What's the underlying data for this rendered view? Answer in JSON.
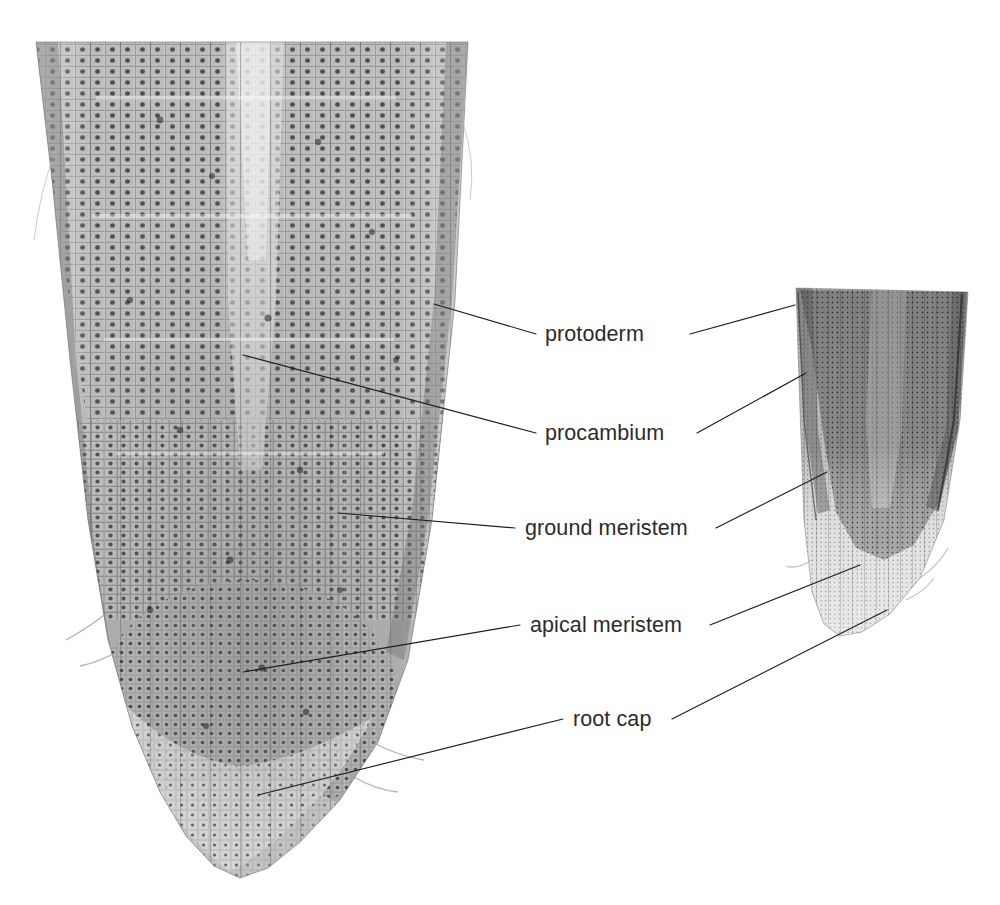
{
  "figure": {
    "kind": "micrograph-figure",
    "background_color": "#ffffff",
    "label_color": "#2b2b2b",
    "leader_line_color": "#1d1d1d",
    "specimens": [
      {
        "name": "large-root-tip-micrograph",
        "position": "left",
        "magnification_note": "high magnification",
        "description": "longitudinal section of root apex showing files of cells, dark nuclei, rounded apex",
        "tone_range": [
          "#ffffff",
          "#4a4a4a"
        ]
      },
      {
        "name": "small-root-tip-micrograph",
        "position": "right",
        "magnification_note": "low magnification",
        "description": "longitudinal section of root apex showing darker meristem region and paler root cap",
        "tone_range": [
          "#ffffff",
          "#5a5a5a"
        ]
      }
    ]
  },
  "labels": [
    {
      "id": "protoderm",
      "text": "protoderm",
      "text_x": 545,
      "text_y": 341,
      "left_leader": [
        [
          434,
          304
        ],
        [
          536,
          334
        ]
      ],
      "right_leader": [
        [
          690,
          334
        ],
        [
          795,
          305
        ]
      ]
    },
    {
      "id": "procambium",
      "text": "procambium",
      "text_x": 545,
      "text_y": 440,
      "left_leader": [
        [
          243,
          355
        ],
        [
          536,
          433
        ]
      ],
      "right_leader": [
        [
          697,
          433
        ],
        [
          806,
          373
        ]
      ]
    },
    {
      "id": "ground-meristem",
      "text": "ground meristem",
      "text_x": 525,
      "text_y": 535,
      "left_leader": [
        [
          338,
          513
        ],
        [
          515,
          528
        ]
      ],
      "right_leader": [
        [
          716,
          528
        ],
        [
          827,
          472
        ]
      ]
    },
    {
      "id": "apical-meristem",
      "text": "apical meristem",
      "text_x": 530,
      "text_y": 632,
      "left_leader": [
        [
          243,
          672
        ],
        [
          520,
          625
        ]
      ],
      "right_leader": [
        [
          710,
          625
        ],
        [
          860,
          565
        ]
      ]
    },
    {
      "id": "root-cap",
      "text": "root cap",
      "text_x": 573,
      "text_y": 726,
      "left_leader": [
        [
          258,
          795
        ],
        [
          563,
          719
        ]
      ],
      "right_leader": [
        [
          672,
          719
        ],
        [
          887,
          610
        ]
      ]
    }
  ]
}
